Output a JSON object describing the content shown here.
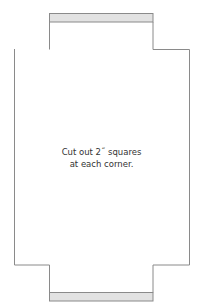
{
  "diagram": {
    "caption_lines": [
      "Cut out 2˝ squares",
      "at each corner."
    ],
    "colors": {
      "outline": "#8a8a8a",
      "tab_fill": "#e2e2e2",
      "background": "#ffffff",
      "text": "#333333"
    },
    "shape": {
      "outer_left_x": 14,
      "outer_right_x": 189,
      "inner_left_x": 49,
      "inner_right_x": 153,
      "top_y": 13,
      "notch_top_y": 49,
      "notch_bottom_y": 265,
      "bottom_y": 301
    },
    "tabs": [
      {
        "name": "top-tab",
        "y": 13,
        "height": 9
      },
      {
        "name": "bottom-tab",
        "y": 292,
        "height": 9
      }
    ]
  }
}
